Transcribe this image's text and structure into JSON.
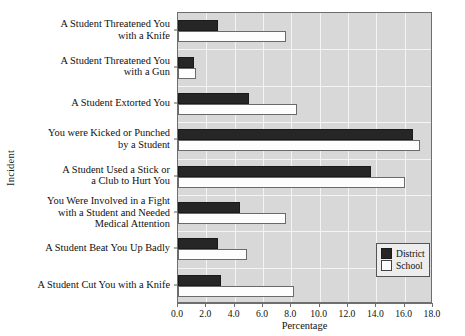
{
  "chart_data": {
    "type": "bar",
    "orientation": "horizontal",
    "title": "",
    "xlabel": "Percentage",
    "ylabel": "Incident",
    "xlim": [
      0.0,
      18.0
    ],
    "xticks": [
      "0.0",
      "2.0",
      "4.0",
      "6.0",
      "8.0",
      "10.0",
      "12.0",
      "14.0",
      "16.0",
      "18.0"
    ],
    "grid": true,
    "legend_position": "bottom-right",
    "categories": [
      "A Student Threatened You\nwith a Knife",
      "A Student Threatened You\nwith a Gun",
      "A Student Extorted You",
      "You were Kicked or Punched\nby a Student",
      "A Student Used a Stick or\na Club to Hurt You",
      "You Were Involved in a Fight\nwith a Student and Needed\nMedical Attention",
      "A Student Beat You Up Badly",
      "A Student Cut You with a Knife"
    ],
    "series": [
      {
        "name": "District",
        "color": "#262626",
        "values": [
          2.8,
          1.1,
          5.0,
          16.6,
          13.6,
          4.4,
          2.8,
          3.0
        ]
      },
      {
        "name": "School",
        "color": "#ffffff",
        "values": [
          7.6,
          1.3,
          8.4,
          17.1,
          16.0,
          7.6,
          4.9,
          8.2
        ]
      }
    ]
  },
  "legend": {
    "entries": [
      {
        "label": "District",
        "style": "filled"
      },
      {
        "label": "School",
        "style": "outline"
      }
    ]
  }
}
